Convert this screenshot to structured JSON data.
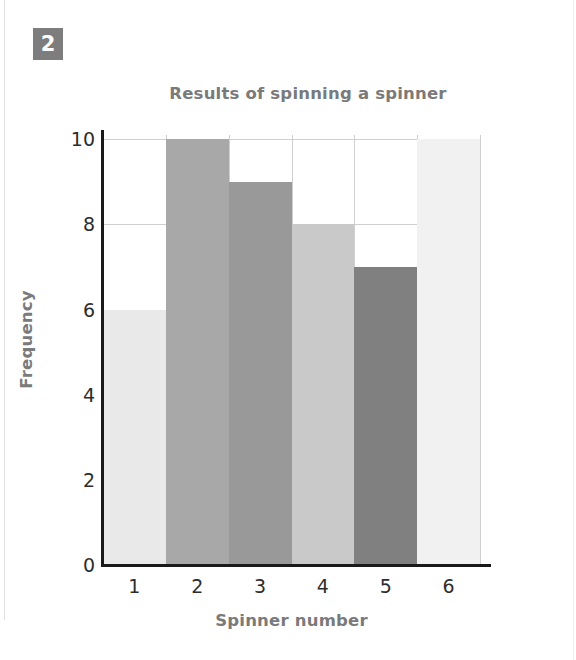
{
  "badge": {
    "number": "2"
  },
  "chart_data": {
    "type": "bar",
    "title": "Results of spinning a spinner",
    "xlabel": "Spinner number",
    "ylabel": "Frequency",
    "categories": [
      "1",
      "2",
      "3",
      "4",
      "5",
      "6"
    ],
    "values": [
      6,
      10,
      9,
      8,
      7,
      10
    ],
    "bar_colors": [
      "#e9e9e9",
      "#a8a8a8",
      "#999999",
      "#c9c9c9",
      "#808080",
      "#f1f1f1"
    ],
    "ylim": [
      0,
      10.1
    ],
    "yticks": [
      0,
      2,
      4,
      6,
      8,
      10
    ],
    "ytick_labels": [
      "0",
      "2",
      "4",
      "6",
      "8",
      "10"
    ],
    "grid": "horizontal-and-vertical",
    "legend": "none",
    "bar_gap": 0
  },
  "colors": {
    "badge_background": "#7d7d7d",
    "badge_text": "#ffffff",
    "title_text": "#7a7a7a",
    "tick_text": "#2d2d2d",
    "axis_line": "#1a1a1a",
    "gridline": "#cfcfcf",
    "page_background": "#ffffff"
  }
}
